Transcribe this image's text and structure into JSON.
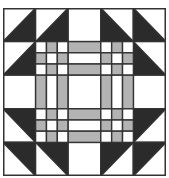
{
  "diagram": {
    "type": "quilt-block",
    "grid": 5,
    "colors": {
      "dark": "#2b2b2b",
      "gray": "#b3b3b3",
      "light": "#ffffff",
      "line": "#333333",
      "background": "#ffffff"
    },
    "outer_cells": [
      {
        "row": 0,
        "col": 0,
        "kind": "hst",
        "dark": "lower-right"
      },
      {
        "row": 0,
        "col": 1,
        "kind": "hst",
        "dark": "lower-right"
      },
      {
        "row": 0,
        "col": 2,
        "kind": "plain"
      },
      {
        "row": 0,
        "col": 3,
        "kind": "hst",
        "dark": "lower-left"
      },
      {
        "row": 0,
        "col": 4,
        "kind": "hst",
        "dark": "lower-left"
      },
      {
        "row": 1,
        "col": 0,
        "kind": "hst",
        "dark": "lower-right"
      },
      {
        "row": 1,
        "col": 4,
        "kind": "hst",
        "dark": "lower-left"
      },
      {
        "row": 2,
        "col": 0,
        "kind": "plain"
      },
      {
        "row": 2,
        "col": 4,
        "kind": "plain"
      },
      {
        "row": 3,
        "col": 0,
        "kind": "hst",
        "dark": "upper-right"
      },
      {
        "row": 3,
        "col": 4,
        "kind": "hst",
        "dark": "upper-left"
      },
      {
        "row": 4,
        "col": 0,
        "kind": "hst",
        "dark": "upper-right"
      },
      {
        "row": 4,
        "col": 1,
        "kind": "hst",
        "dark": "upper-right"
      },
      {
        "row": 4,
        "col": 2,
        "kind": "plain"
      },
      {
        "row": 4,
        "col": 3,
        "kind": "hst",
        "dark": "upper-left"
      },
      {
        "row": 4,
        "col": 4,
        "kind": "hst",
        "dark": "upper-left"
      }
    ],
    "inner_cells": [
      {
        "row": 1,
        "col": 1,
        "kind": "ninepatch"
      },
      {
        "row": 1,
        "col": 2,
        "kind": "strips-h"
      },
      {
        "row": 1,
        "col": 3,
        "kind": "ninepatch"
      },
      {
        "row": 2,
        "col": 1,
        "kind": "strips-v"
      },
      {
        "row": 2,
        "col": 2,
        "kind": "plain"
      },
      {
        "row": 2,
        "col": 3,
        "kind": "strips-v"
      },
      {
        "row": 3,
        "col": 1,
        "kind": "ninepatch"
      },
      {
        "row": 3,
        "col": 2,
        "kind": "strips-h"
      },
      {
        "row": 3,
        "col": 3,
        "kind": "ninepatch"
      }
    ],
    "ninepatch_pattern": [
      [
        "light",
        "gray",
        "light"
      ],
      [
        "gray",
        "light",
        "gray"
      ],
      [
        "light",
        "gray",
        "light"
      ]
    ],
    "strip_pattern": [
      "gray",
      "light",
      "gray"
    ]
  }
}
